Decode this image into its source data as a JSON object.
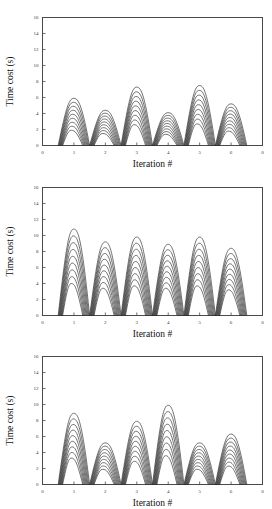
{
  "figure": {
    "background": "#ffffff",
    "ink_color": "#1a1a1a",
    "axis_color": "#4a4a4a",
    "panel_count": 3
  },
  "axes": {
    "ylabel": "Time cost (s)",
    "xlabel": "Iteration #",
    "y_ticks": [
      "0",
      "2",
      "4",
      "6",
      "8",
      "10",
      "12",
      "14",
      "16"
    ],
    "x_ticks": [
      "0",
      "1",
      "2",
      "3",
      "4",
      "5",
      "6",
      "0"
    ],
    "ylim": [
      0,
      16
    ],
    "xlim": [
      0,
      7
    ]
  },
  "chart_data": [
    {
      "type": "line",
      "title": "",
      "xlabel": "Iteration #",
      "ylabel": "Time cost (s)",
      "xlim": [
        0,
        7
      ],
      "ylim": [
        0,
        16
      ],
      "grid": false,
      "legend": "none",
      "x_tick_labels": [
        "0",
        "1",
        "2",
        "3",
        "4",
        "5",
        "6",
        "0"
      ],
      "y_tick_labels": [
        "0",
        "2",
        "4",
        "6",
        "8",
        "10",
        "12",
        "14",
        "16"
      ],
      "categories": [
        1,
        2,
        3,
        4,
        5,
        6
      ],
      "curves_per_cluster": 9,
      "description": "Nested arc bundle per iteration; outer arc is the maximum, inner arcs are progressively lower runs.",
      "series": [
        {
          "name": "peak-max",
          "values": [
            5.9,
            4.4,
            7.3,
            4.1,
            7.5,
            5.2
          ]
        },
        {
          "name": "peak-min",
          "values": [
            1.9,
            1.5,
            2.6,
            1.4,
            2.7,
            1.8
          ]
        }
      ]
    },
    {
      "type": "line",
      "title": "",
      "xlabel": "Iteration #",
      "ylabel": "Time cost (s)",
      "xlim": [
        0,
        7
      ],
      "ylim": [
        0,
        16
      ],
      "grid": false,
      "legend": "none",
      "x_tick_labels": [
        "0",
        "1",
        "2",
        "3",
        "4",
        "5",
        "6",
        "0"
      ],
      "y_tick_labels": [
        "0",
        "2",
        "4",
        "6",
        "8",
        "10",
        "12",
        "14",
        "16"
      ],
      "categories": [
        1,
        2,
        3,
        4,
        5,
        6
      ],
      "curves_per_cluster": 9,
      "description": "Nested arc bundle per iteration; outer arc is the maximum, inner arcs are progressively lower runs.",
      "series": [
        {
          "name": "peak-max",
          "values": [
            10.8,
            9.2,
            9.8,
            8.9,
            9.8,
            8.4
          ]
        },
        {
          "name": "peak-min",
          "values": [
            4.0,
            3.4,
            3.7,
            3.4,
            3.7,
            3.2
          ]
        }
      ]
    },
    {
      "type": "line",
      "title": "",
      "xlabel": "Iteration #",
      "ylabel": "Time cost (s)",
      "xlim": [
        0,
        7
      ],
      "ylim": [
        0,
        16
      ],
      "grid": false,
      "legend": "none",
      "x_tick_labels": [
        "0",
        "1",
        "2",
        "3",
        "4",
        "5",
        "6",
        "0"
      ],
      "y_tick_labels": [
        "0",
        "2",
        "4",
        "6",
        "8",
        "10",
        "12",
        "14",
        "16"
      ],
      "categories": [
        1,
        2,
        3,
        4,
        5,
        6
      ],
      "curves_per_cluster": 9,
      "description": "Nested arc bundle per iteration; outer arc is the maximum, inner arcs are progressively lower runs.",
      "series": [
        {
          "name": "peak-max",
          "values": [
            8.9,
            5.2,
            7.9,
            9.9,
            5.2,
            6.3
          ]
        },
        {
          "name": "peak-min",
          "values": [
            3.3,
            1.9,
            2.9,
            3.6,
            1.9,
            2.3
          ]
        }
      ]
    }
  ]
}
